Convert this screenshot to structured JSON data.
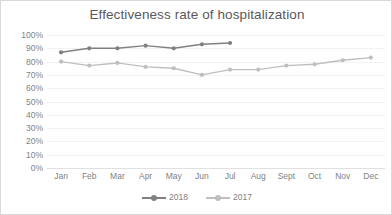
{
  "chart_data": {
    "type": "line",
    "title": "Effectiveness rate of hospitalization",
    "xlabel": "",
    "ylabel": "",
    "categories": [
      "Jan",
      "Feb",
      "Mar",
      "Apr",
      "May",
      "Jun",
      "Jul",
      "Aug",
      "Sept",
      "Oct",
      "Nov",
      "Dec"
    ],
    "ylim": [
      0,
      100
    ],
    "ytick_labels": [
      "100%",
      "90%",
      "80%",
      "70%",
      "60%",
      "50%",
      "40%",
      "30%",
      "20%",
      "10%",
      "0%"
    ],
    "ytick_values": [
      100,
      90,
      80,
      70,
      60,
      50,
      40,
      30,
      20,
      10,
      0
    ],
    "grid": true,
    "legend_position": "bottom",
    "value_unit": "%",
    "series": [
      {
        "name": "2018",
        "color": "#808080",
        "marker": "circle",
        "values": [
          87,
          90,
          90,
          92,
          90,
          93,
          94,
          null,
          null,
          null,
          null,
          null
        ]
      },
      {
        "name": "2017",
        "color": "#bfbfbf",
        "marker": "circle",
        "values": [
          80,
          77,
          79,
          76,
          75,
          70,
          74,
          74,
          77,
          78,
          81,
          83
        ]
      }
    ]
  },
  "colors": {
    "series_2018": "#808080",
    "series_2017": "#bfbfbf",
    "gridline": "#f2f2f2",
    "axis": "#e0e0e0",
    "text": "#7f7f7f",
    "title_text": "#595959",
    "border": "#d9d9d9",
    "background": "#ffffff"
  }
}
